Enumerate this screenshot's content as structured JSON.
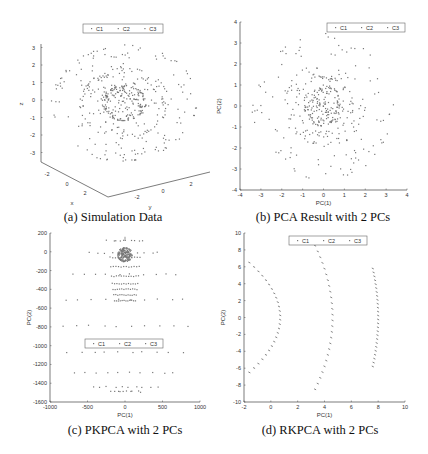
{
  "chart_data": [
    {
      "id": "a",
      "type": "scatter",
      "subtype": "scatter3d",
      "caption": "(a) Simulation Data",
      "xlabel": "x",
      "ylabel": "y",
      "zlabel": "z",
      "zticks": [
        3,
        2,
        1,
        0,
        -1,
        -2,
        -3
      ],
      "xticks": [
        -2,
        0,
        2
      ],
      "yticks": [
        -2,
        0,
        2
      ],
      "zlim": [
        -3.5,
        3.3
      ],
      "legend": [
        "C1",
        "C2",
        "C3"
      ],
      "legend_position": "top-center",
      "series": [
        {
          "name": "C1",
          "shape": "sphere",
          "radius": 1
        },
        {
          "name": "C2",
          "shape": "sphere",
          "radius": 2
        },
        {
          "name": "C3",
          "shape": "sphere",
          "radius": 3.3
        }
      ]
    },
    {
      "id": "b",
      "type": "scatter",
      "caption": "(b) PCA Result with 2 PCs",
      "xlabel": "PC(1)",
      "ylabel": "PC(2)",
      "xlim": [
        -4,
        4
      ],
      "ylim": [
        -4,
        4
      ],
      "xticks": [
        -4,
        -3,
        -2,
        -1,
        0,
        1,
        2,
        3,
        4
      ],
      "yticks": [
        4,
        3,
        2,
        1,
        0,
        -1,
        -2,
        -3,
        -4
      ],
      "legend": [
        "C1",
        "C2",
        "C3"
      ],
      "legend_position": "top-right",
      "series": [
        {
          "name": "C1",
          "shape": "disk",
          "radius": 1
        },
        {
          "name": "C2",
          "shape": "ring",
          "radius": 2
        },
        {
          "name": "C3",
          "shape": "ring",
          "radius": 3.4
        }
      ]
    },
    {
      "id": "c",
      "type": "scatter",
      "caption": "(c) PKPCA with 2 PCs",
      "xlabel": "PC(1)",
      "ylabel": "PC(2)",
      "xlim": [
        -1000,
        1000
      ],
      "ylim": [
        -1600,
        200
      ],
      "xticks": [
        -1000,
        -500,
        0,
        500,
        1000
      ],
      "yticks": [
        200,
        0,
        -200,
        -400,
        -600,
        -800,
        -1000,
        -1200,
        -1400,
        -1600
      ],
      "legend": [
        "C1",
        "C2",
        "C3"
      ],
      "legend_position": "center",
      "series": [
        {
          "name": "C1",
          "shape": "dense-cluster",
          "center": [
            0,
            -30
          ],
          "extent": [
            100,
            80
          ]
        },
        {
          "name": "C2",
          "shape": "bands",
          "rows": [
            -60,
            -160,
            -260,
            -340,
            -400,
            -460,
            -520
          ]
        },
        {
          "name": "C3",
          "shape": "bands",
          "rows": [
            120,
            -10,
            -240,
            -510,
            -790,
            -1070,
            -1290,
            -1440,
            -1490
          ]
        }
      ]
    },
    {
      "id": "d",
      "type": "scatter",
      "caption": "(d) RKPCA with 2 PCs",
      "xlabel": "PC(1)",
      "ylabel": "PC(2)",
      "xlim": [
        -2,
        10
      ],
      "ylim": [
        -10,
        10
      ],
      "xticks": [
        -2,
        0,
        2,
        4,
        6,
        8,
        10
      ],
      "yticks": [
        10,
        8,
        6,
        4,
        2,
        0,
        -2,
        -4,
        -6,
        -8,
        -10
      ],
      "legend": [
        "C1",
        "C2",
        "C3"
      ],
      "legend_position": "top-center",
      "series": [
        {
          "name": "C1",
          "shape": "arc",
          "x_range": [
            -1.6,
            0.7
          ],
          "y_range": [
            -6.5,
            6.5
          ]
        },
        {
          "name": "C2",
          "shape": "arc",
          "x_range": [
            3.3,
            4.6
          ],
          "y_range": [
            -8.5,
            8.5
          ]
        },
        {
          "name": "C3",
          "shape": "arc",
          "x_range": [
            7.6,
            8.0
          ],
          "y_range": [
            -5.8,
            5.8
          ]
        }
      ]
    }
  ]
}
